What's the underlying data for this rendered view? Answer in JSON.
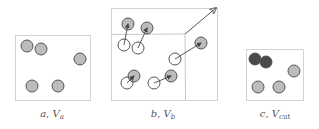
{
  "colors": {
    "box_stroke": "#d2d2d2",
    "inner_line": "#c8c8c8",
    "particle_fill": "#bcbcbc",
    "particle_stroke": "#555555",
    "cut_particle_fill": "#4a4a4a",
    "hollow_fill": "#ffffff",
    "arrow": "#555555",
    "label": "#555555"
  },
  "panels": [
    {
      "id": "a",
      "label_var": "a",
      "label_sym": "V",
      "label_sub": "a",
      "box": {
        "x": 15,
        "y": 35,
        "w": 75,
        "h": 65
      },
      "particles": [
        {
          "cx": 27,
          "cy": 46,
          "type": "filled"
        },
        {
          "cx": 41,
          "cy": 49,
          "type": "filled"
        },
        {
          "cx": 80,
          "cy": 59,
          "type": "filled"
        },
        {
          "cx": 32,
          "cy": 86,
          "type": "filled"
        },
        {
          "cx": 58,
          "cy": 86,
          "type": "filled"
        }
      ]
    },
    {
      "id": "b",
      "label_var": "b",
      "label_sym": "V",
      "label_sub": "b",
      "box": {
        "x": 111,
        "y": 8,
        "w": 106,
        "h": 92
      },
      "inner_lines": [
        {
          "x1": 111,
          "y1": 34,
          "x2": 185,
          "y2": 34
        },
        {
          "x1": 185,
          "y1": 34,
          "x2": 185,
          "y2": 100
        }
      ],
      "growth_arrow": {
        "x1": 185,
        "y1": 34,
        "x2": 216,
        "y2": 8
      },
      "moves": [
        {
          "from": {
            "cx": 124,
            "cy": 45
          },
          "to": {
            "cx": 128,
            "cy": 24
          }
        },
        {
          "from": {
            "cx": 138,
            "cy": 48
          },
          "to": {
            "cx": 147,
            "cy": 28
          }
        },
        {
          "from": {
            "cx": 175,
            "cy": 59
          },
          "to": {
            "cx": 201,
            "cy": 43
          }
        },
        {
          "from": {
            "cx": 127,
            "cy": 83
          },
          "to": {
            "cx": 134,
            "cy": 76
          }
        },
        {
          "from": {
            "cx": 154,
            "cy": 83
          },
          "to": {
            "cx": 171,
            "cy": 76
          }
        }
      ]
    },
    {
      "id": "c",
      "label_var": "c",
      "label_sym": "V",
      "label_sub": "cut",
      "box": {
        "x": 246,
        "y": 49,
        "w": 57,
        "h": 51
      },
      "particles": [
        {
          "cx": 255,
          "cy": 59,
          "type": "cut"
        },
        {
          "cx": 266,
          "cy": 62,
          "type": "cut"
        },
        {
          "cx": 294,
          "cy": 71,
          "type": "filled"
        },
        {
          "cx": 258,
          "cy": 87,
          "type": "filled"
        },
        {
          "cx": 279,
          "cy": 87,
          "type": "filled"
        }
      ]
    }
  ],
  "labels": [
    {
      "x": 52,
      "y": 117,
      "text_var": "a",
      "text_sym": "V",
      "text_sub": "a"
    },
    {
      "x": 163,
      "y": 117,
      "text_var": "b",
      "text_sym": "V",
      "text_sub": "b"
    },
    {
      "x": 275,
      "y": 117,
      "text_var": "c",
      "text_sym": "V",
      "text_sub": "cut"
    }
  ]
}
